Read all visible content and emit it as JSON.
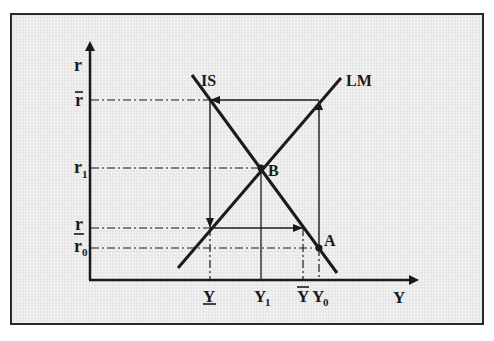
{
  "diagram": {
    "type": "IS-LM",
    "colors": {
      "background": "#e6e6e6",
      "ink": "#1a1a1a",
      "frame": "#2a2a2a"
    },
    "axes": {
      "y_label": "r",
      "x_label": "Y"
    },
    "curves": {
      "is_label": "IS",
      "lm_label": "LM"
    },
    "points": {
      "b_label": "B",
      "a_label": "A"
    },
    "y_ticks": {
      "r_bar": "r",
      "r1_base": "r",
      "r1_sub": "1",
      "r_under": "r",
      "r0_base": "r",
      "r0_sub": "0"
    },
    "x_ticks": {
      "y_under": "Y",
      "y1_base": "Y",
      "y1_sub": "1",
      "y_bar": "Y",
      "y0_base": "Y",
      "y0_sub": "0"
    }
  }
}
